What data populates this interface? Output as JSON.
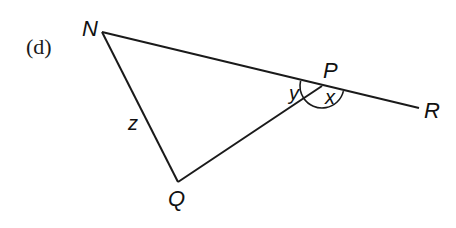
{
  "figure": {
    "part_label": "(d)",
    "colors": {
      "line": "#1a1a1a",
      "text": "#111111",
      "background": "#ffffff"
    },
    "points": {
      "N": {
        "label": "N",
        "x": 102,
        "y": 32
      },
      "P": {
        "label": "P",
        "x": 322,
        "y": 86
      },
      "R": {
        "label": "R",
        "x": 419,
        "y": 108
      },
      "Q": {
        "label": "Q",
        "x": 178,
        "y": 182
      }
    },
    "segments": [
      {
        "from": "N",
        "to": "R",
        "name": "line-NR"
      },
      {
        "from": "N",
        "to": "Q",
        "name": "side-NQ"
      },
      {
        "from": "Q",
        "to": "P",
        "name": "side-QP"
      }
    ],
    "angles": {
      "y": {
        "label": "y",
        "at": "P",
        "between": [
          "N",
          "Q"
        ]
      },
      "x": {
        "label": "x",
        "at": "P",
        "between": [
          "Q",
          "R"
        ]
      },
      "z": {
        "label": "z",
        "at": "N-Q side",
        "note": "side/angle label near NQ"
      }
    }
  }
}
